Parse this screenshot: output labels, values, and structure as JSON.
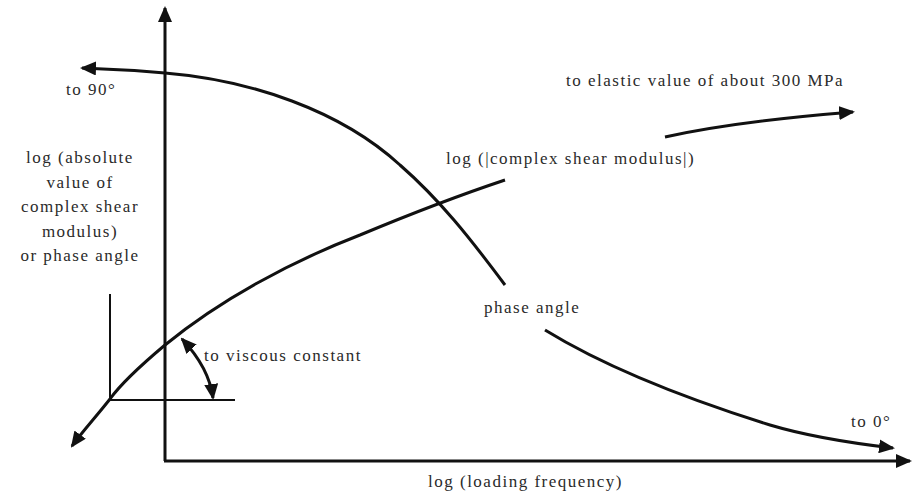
{
  "figure": {
    "type": "schematic"
  },
  "axes": {
    "x_label": "log (loading frequency)",
    "y_label_lines": [
      "log (absolute",
      "value of",
      "complex shear",
      "modulus)",
      "or phase angle"
    ]
  },
  "curves": {
    "modulus": {
      "label": "log (|complex shear modulus|)",
      "high_freq_annotation": "to elastic value of about 300 MPa",
      "low_freq_annotation": "to viscous constant"
    },
    "phase_angle": {
      "label": "phase angle",
      "low_freq_annotation": "to 90°",
      "high_freq_annotation": "to 0°"
    }
  },
  "colors": {
    "line": "#111111",
    "text": "#2a2a2a",
    "background": "#ffffff"
  }
}
